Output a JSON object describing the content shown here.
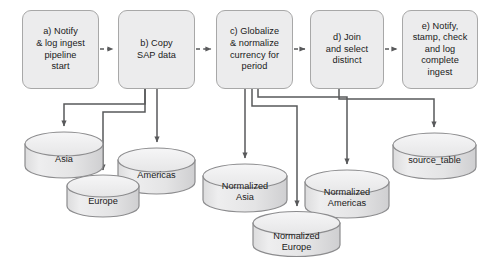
{
  "diagram": {
    "background_color": "#ffffff",
    "node_fill": "#ececed",
    "node_stroke": "#a8a8a8",
    "connector_color": "#58595b",
    "process_steps": [
      {
        "id": "step-a",
        "label": "a) Notify\n& log ingest\npipeline\nstart",
        "x": 22,
        "y": 10,
        "w": 77,
        "h": 79
      },
      {
        "id": "step-b",
        "label": "b) Copy\nSAP data",
        "x": 118,
        "y": 10,
        "w": 77,
        "h": 79
      },
      {
        "id": "step-c",
        "label": "c) Globalize\n& normalize\ncurrency for\nperiod",
        "x": 216,
        "y": 10,
        "w": 77,
        "h": 79
      },
      {
        "id": "step-d",
        "label": "d) Join\nand select\ndistinct",
        "x": 310,
        "y": 10,
        "w": 74,
        "h": 79
      },
      {
        "id": "step-e",
        "label": "e) Notify,\nstamp, check\nand log\ncomplete\ningest",
        "x": 402,
        "y": 10,
        "w": 76,
        "h": 79
      }
    ],
    "datastores": [
      {
        "id": "asia",
        "label": "Asia",
        "x": 25,
        "y": 130,
        "w": 78,
        "h": 50
      },
      {
        "id": "americas",
        "label": "Americas",
        "x": 118,
        "y": 146,
        "w": 77,
        "h": 50
      },
      {
        "id": "europe",
        "label": "Europe",
        "x": 67,
        "y": 174,
        "w": 72,
        "h": 44
      },
      {
        "id": "normalized-asia",
        "label": "Normalized\nAsia",
        "x": 203,
        "y": 162,
        "w": 84,
        "h": 52
      },
      {
        "id": "normalized-americas",
        "label": "Normalized\nAmericas",
        "x": 305,
        "y": 168,
        "w": 84,
        "h": 52
      },
      {
        "id": "normalized-europe",
        "label": "Normalized\nEurope",
        "x": 253,
        "y": 210,
        "w": 87,
        "h": 48
      },
      {
        "id": "source-table",
        "label": "source_table",
        "x": 393,
        "y": 131,
        "w": 83,
        "h": 50
      }
    ],
    "flow_connections": [
      {
        "from": "step-a",
        "to": "step-b",
        "style": "dashed"
      },
      {
        "from": "step-b",
        "to": "step-c",
        "style": "dashed"
      },
      {
        "from": "step-c",
        "to": "step-d",
        "style": "dashed"
      },
      {
        "from": "step-d",
        "to": "step-e",
        "style": "dashed"
      },
      {
        "from": "step-b",
        "to": "asia",
        "style": "solid"
      },
      {
        "from": "step-b",
        "to": "americas",
        "style": "solid"
      },
      {
        "from": "step-b",
        "to": "europe",
        "style": "solid"
      },
      {
        "from": "step-c",
        "to": "normalized-asia",
        "style": "solid"
      },
      {
        "from": "step-c",
        "to": "normalized-americas",
        "style": "solid"
      },
      {
        "from": "step-c",
        "to": "normalized-europe",
        "style": "solid"
      },
      {
        "from": "step-d",
        "to": "source-table",
        "style": "solid"
      }
    ]
  }
}
